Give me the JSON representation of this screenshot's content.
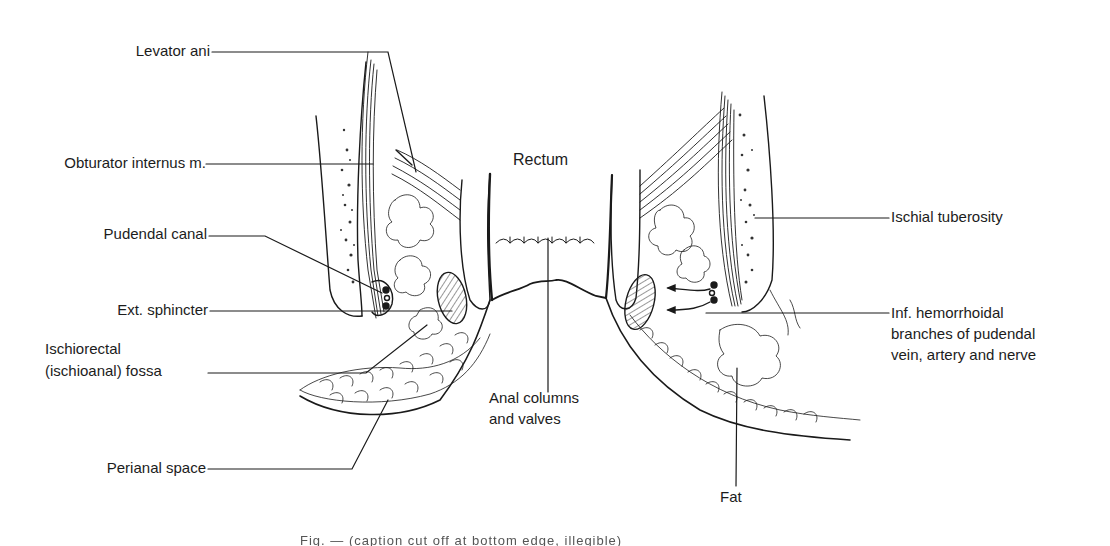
{
  "figure": {
    "type": "anatomical-line-drawing",
    "labels": {
      "levator_ani": "Levator ani",
      "obturator_internus": "Obturator internus m.",
      "pudendal_canal": "Pudendal canal",
      "ext_sphincter": "Ext. sphincter",
      "ischiorectal_line1": "Ischiorectal",
      "ischiorectal_line2": "(ischioanal) fossa",
      "perianal_space": "Perianal space",
      "rectum": "Rectum",
      "anal_columns_line1": "Anal columns",
      "anal_columns_line2": "and valves",
      "ischial_tuberosity": "Ischial tuberosity",
      "inf_hemorrhoidal_line1": "Inf. hemorrhoidal",
      "inf_hemorrhoidal_line2": "branches of pudendal",
      "inf_hemorrhoidal_line3": "vein, artery and nerve",
      "fat": "Fat"
    },
    "caption": "Fig. — (caption cut off at bottom edge, illegible)"
  },
  "colors": {
    "ink": "#1a1a1a",
    "background": "#ffffff"
  }
}
